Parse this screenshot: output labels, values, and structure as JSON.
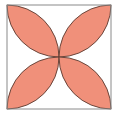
{
  "diagram": {
    "type": "geometry",
    "square": {
      "x": 7,
      "y": 5,
      "size": 104,
      "stroke": "#8a8a8a"
    },
    "petals": [
      "top-left",
      "top-right",
      "bottom-left",
      "bottom-right"
    ],
    "colors": {
      "petal_fill": "#F0907A",
      "petal_stroke": "#5a3a30",
      "background": "#ffffff"
    }
  }
}
